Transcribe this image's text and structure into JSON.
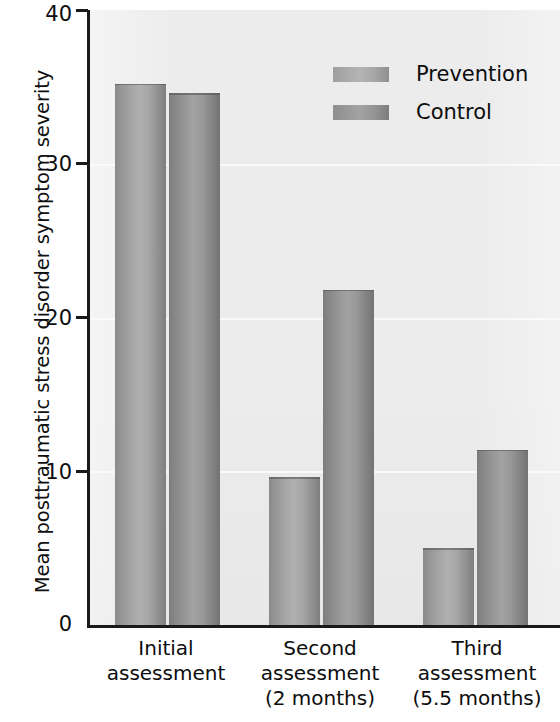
{
  "chart_data": {
    "type": "bar",
    "title": "",
    "xlabel": "",
    "ylabel": "Mean posttraumatic stress disorder symptom severity",
    "ylim": [
      0,
      40
    ],
    "yticks": [
      0,
      10,
      20,
      30,
      40
    ],
    "ytick_labels": [
      "0",
      "10",
      "20",
      "30",
      "40"
    ],
    "grid": true,
    "legend_position": "top-right",
    "categories": [
      "Initial assessment",
      "Second assessment (2 months)",
      "Third assessment (5.5 months)"
    ],
    "category_lines": [
      [
        "Initial",
        "assessment"
      ],
      [
        "Second",
        "assessment",
        "(2 months)"
      ],
      [
        "Third",
        "assessment",
        "(5.5 months)"
      ]
    ],
    "series": [
      {
        "name": "Prevention",
        "values": [
          35.2,
          9.6,
          5.0
        ],
        "color": "#a8a8a8"
      },
      {
        "name": "Control",
        "values": [
          34.6,
          21.8,
          11.4
        ],
        "color": "#949494"
      }
    ]
  },
  "legend": {
    "items": [
      {
        "label": "Prevention"
      },
      {
        "label": "Control"
      }
    ]
  },
  "axis": {
    "y_title": "Mean posttraumatic stress disorder symptom severity",
    "tick_0": "0",
    "tick_10": "10",
    "tick_20": "20",
    "tick_30": "30",
    "tick_40": "40"
  },
  "categories": {
    "g1_l1": "Initial",
    "g1_l2": "assessment",
    "g2_l1": "Second",
    "g2_l2": "assessment",
    "g2_l3": "(2 months)",
    "g3_l1": "Third",
    "g3_l2": "assessment",
    "g3_l3": "(5.5 months)"
  },
  "colors": {
    "plot_background": "#ececec",
    "axis": "#1a1a1a",
    "gridline": "#fafafa",
    "prevention": "#a8a8a8",
    "control": "#949494"
  }
}
